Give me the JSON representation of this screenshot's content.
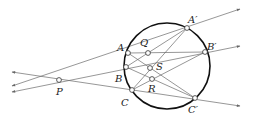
{
  "figure": {
    "type": "projective geometry diagram (Pascal / perspective lines through a circle)",
    "circle": {
      "cx": 167,
      "cy": 66,
      "r": 43
    },
    "points": [
      {
        "id": "P",
        "label": "P",
        "x": 59,
        "y": 80,
        "lx": 56,
        "ly": 95
      },
      {
        "id": "A",
        "label": "A",
        "x": 128,
        "y": 53,
        "lx": 117,
        "ly": 51
      },
      {
        "id": "B",
        "label": "B",
        "x": 126,
        "y": 67,
        "lx": 115,
        "ly": 82
      },
      {
        "id": "C",
        "label": "C",
        "x": 132,
        "y": 90,
        "lx": 121,
        "ly": 106
      },
      {
        "id": "A2",
        "label": "A′",
        "x": 187,
        "y": 28,
        "lx": 188,
        "ly": 23
      },
      {
        "id": "B2",
        "label": "B′",
        "x": 205,
        "y": 52,
        "lx": 207,
        "ly": 50
      },
      {
        "id": "C2",
        "label": "C′",
        "x": 195,
        "y": 98,
        "lx": 188,
        "ly": 113
      },
      {
        "id": "Q",
        "label": "Q",
        "x": 148,
        "y": 53,
        "lx": 140,
        "ly": 46
      },
      {
        "id": "S",
        "label": "S",
        "x": 150,
        "y": 68,
        "lx": 156,
        "ly": 70
      },
      {
        "id": "R",
        "label": "R",
        "x": 152,
        "y": 79,
        "lx": 148,
        "ly": 92
      }
    ],
    "rays": [
      {
        "from": "P",
        "through": "A2",
        "arrow_end": [
          240,
          9
        ],
        "arrow_start": [
          12,
          86
        ]
      },
      {
        "from": "P",
        "through": "B2",
        "arrow_end": [
          240,
          46
        ],
        "arrow_start": [
          12,
          92
        ]
      },
      {
        "from": "P",
        "through": "C2",
        "arrow_end": [
          240,
          106
        ],
        "arrow_start": [
          12,
          72
        ]
      }
    ],
    "segments": [
      [
        "A",
        "B2"
      ],
      [
        "A",
        "C2"
      ],
      [
        "B",
        "A2"
      ],
      [
        "B",
        "C2"
      ],
      [
        "C",
        "A2"
      ],
      [
        "C",
        "B2"
      ]
    ]
  }
}
